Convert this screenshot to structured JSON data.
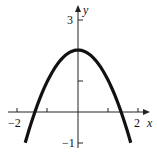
{
  "chart_data": {
    "type": "line",
    "title": "",
    "xlabel": "x",
    "ylabel": "y",
    "equation": "y = 2 - x^2",
    "xlim": [
      -2.2,
      2.2
    ],
    "ylim": [
      -1.1,
      3.3
    ],
    "x_ticks": [
      -2,
      -1,
      1,
      2
    ],
    "x_tick_labels": [
      "-2",
      "",
      "",
      "2"
    ],
    "y_ticks": [
      -1,
      1,
      2,
      3
    ],
    "y_tick_labels": [
      "-1",
      "",
      "",
      "3"
    ],
    "grid": false,
    "series": [
      {
        "name": "parabola",
        "x": [
          -1.73,
          -1.5,
          -1,
          -0.5,
          0,
          0.5,
          1,
          1.5,
          1.73
        ],
        "values": [
          -1,
          -0.25,
          1,
          1.75,
          2,
          1.75,
          1,
          -0.25,
          -1
        ]
      }
    ]
  },
  "labels": {
    "x_axis": "x",
    "y_axis": "y",
    "x_neg2": "−2",
    "x_pos2": "2",
    "y_pos3": "3",
    "y_neg1": "−1"
  }
}
